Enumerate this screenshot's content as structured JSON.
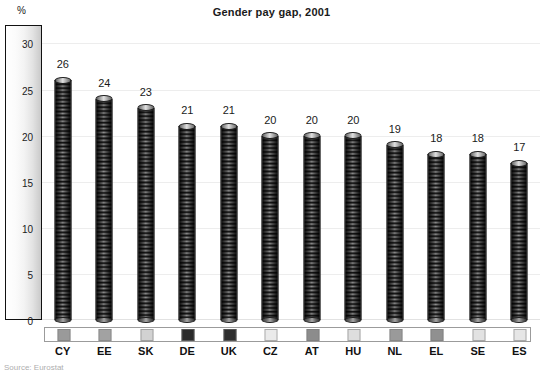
{
  "chart_data": {
    "type": "bar",
    "title": "Gender pay gap, 2001",
    "xlabel": "",
    "ylabel": "%",
    "ylim": [
      0,
      32
    ],
    "grid": true,
    "legend_position": "bottom",
    "categories": [
      "CY",
      "EE",
      "SK",
      "DE",
      "UK",
      "CZ",
      "AT",
      "HU",
      "NL",
      "EL",
      "SE",
      "ES"
    ],
    "values": [
      26,
      24,
      23,
      21,
      21,
      20,
      20,
      20,
      19,
      18,
      18,
      17
    ],
    "value_labels": [
      "26",
      "24",
      "23",
      "21",
      "21",
      "20",
      "20",
      "20",
      "19",
      "18",
      "18",
      "17"
    ],
    "y_ticks": [
      0,
      5,
      10,
      15,
      20,
      25,
      30
    ],
    "y_tick_labels": [
      "0",
      "5",
      "10",
      "15",
      "20",
      "25",
      "30"
    ],
    "series": [
      {
        "name": "Gender pay gap",
        "values": [
          26,
          24,
          23,
          21,
          21,
          20,
          20,
          20,
          19,
          18,
          18,
          17
        ]
      }
    ],
    "swatch_colors": [
      "#9a9a9a",
      "#a2a2a2",
      "#d2d2d2",
      "#2a2a2a",
      "#2e2e2e",
      "#eaeaea",
      "#8c8c8c",
      "#dedede",
      "#9a9a9a",
      "#909090",
      "#e2e2e2",
      "#e6e6e6"
    ]
  },
  "axis": {
    "unit_label": "%"
  },
  "footer": {
    "source_note": "Source: Eurostat"
  }
}
